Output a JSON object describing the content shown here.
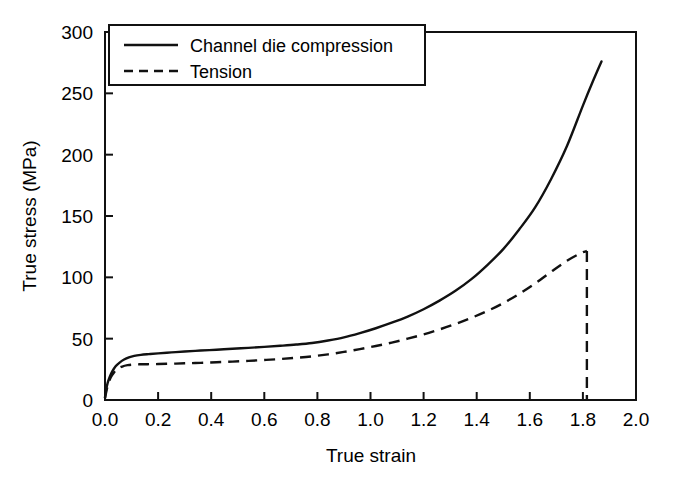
{
  "chart_data": {
    "type": "line",
    "title": "",
    "xlabel": "True strain",
    "ylabel": "True stress (MPa)",
    "xlim": [
      0.0,
      2.0
    ],
    "ylim": [
      0,
      300
    ],
    "xticks": [
      "0.0",
      "0.2",
      "0.4",
      "0.6",
      "0.8",
      "1.0",
      "1.2",
      "1.4",
      "1.6",
      "1.8",
      "2.0"
    ],
    "xtick_values": [
      0.0,
      0.2,
      0.4,
      0.6,
      0.8,
      1.0,
      1.2,
      1.4,
      1.6,
      1.8,
      2.0
    ],
    "yticks": [
      "0",
      "50",
      "100",
      "150",
      "200",
      "250",
      "300"
    ],
    "ytick_values": [
      0,
      50,
      100,
      150,
      200,
      250,
      300
    ],
    "grid": false,
    "legend_position": "top-left",
    "line_color": "#111111",
    "series": [
      {
        "name": "Channel die compression",
        "style": "solid",
        "x": [
          0.0,
          0.004,
          0.01,
          0.018,
          0.028,
          0.04,
          0.055,
          0.072,
          0.09,
          0.11,
          0.135,
          0.165,
          0.2,
          0.25,
          0.3,
          0.36,
          0.42,
          0.48,
          0.54,
          0.6,
          0.66,
          0.72,
          0.78,
          0.84,
          0.9,
          0.96,
          1.02,
          1.08,
          1.14,
          1.2,
          1.26,
          1.32,
          1.38,
          1.44,
          1.5,
          1.56,
          1.62,
          1.68,
          1.74,
          1.8,
          1.84,
          1.87
        ],
        "y": [
          2.0,
          8.0,
          14.0,
          19.0,
          23.5,
          27.5,
          30.5,
          33.0,
          34.8,
          36.0,
          36.8,
          37.4,
          38.0,
          38.8,
          39.5,
          40.3,
          41.0,
          41.8,
          42.5,
          43.3,
          44.2,
          45.2,
          46.5,
          48.5,
          51.0,
          54.5,
          58.5,
          63.0,
          68.0,
          74.0,
          81.0,
          89.0,
          98.5,
          110.0,
          123.0,
          139.0,
          157.0,
          180.0,
          207.0,
          240.0,
          261.0,
          276.0
        ]
      },
      {
        "name": "Tension",
        "style": "dashed",
        "x": [
          0.0,
          0.005,
          0.012,
          0.022,
          0.034,
          0.048,
          0.065,
          0.085,
          0.105,
          0.13,
          0.16,
          0.2,
          0.25,
          0.3,
          0.36,
          0.42,
          0.48,
          0.54,
          0.6,
          0.66,
          0.72,
          0.78,
          0.84,
          0.9,
          0.96,
          1.02,
          1.08,
          1.14,
          1.2,
          1.26,
          1.32,
          1.38,
          1.44,
          1.5,
          1.56,
          1.62,
          1.68,
          1.74,
          1.79,
          1.815
        ],
        "y": [
          1.5,
          7.0,
          13.0,
          18.5,
          22.5,
          25.5,
          27.3,
          28.4,
          28.9,
          29.1,
          29.2,
          29.3,
          29.6,
          29.9,
          30.3,
          30.8,
          31.3,
          31.9,
          32.6,
          33.4,
          34.4,
          35.6,
          37.2,
          39.2,
          41.5,
          44.0,
          46.8,
          50.0,
          53.5,
          57.5,
          62.0,
          67.0,
          72.5,
          79.0,
          86.5,
          95.0,
          104.5,
          113.5,
          119.5,
          121.5
        ]
      }
    ],
    "annotations": [
      {
        "name": "tension-failure-drop",
        "description": "vertical dashed drop to zero at fracture",
        "x": 1.815,
        "y_from": 121.5,
        "y_to": 0
      }
    ]
  },
  "legend": {
    "entries": [
      {
        "label": "Channel die compression",
        "style": "solid"
      },
      {
        "label": "Tension",
        "style": "dashed"
      }
    ]
  },
  "axes": {
    "x_title": "True strain",
    "y_title": "True stress (MPa)"
  }
}
